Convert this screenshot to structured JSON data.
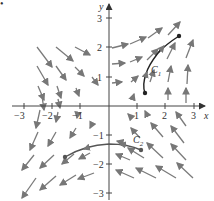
{
  "figure": {
    "dot_marker": "•",
    "axes": {
      "x_label": "x",
      "y_label": "y",
      "x_ticks": [
        "−3",
        "−2",
        "−1",
        "1",
        "2",
        "3"
      ],
      "y_ticks": [
        "3",
        "2",
        "1",
        "−1",
        "−2",
        "−3"
      ]
    },
    "curves": [
      {
        "name": "C",
        "subscript": "1"
      },
      {
        "name": "C",
        "subscript": "2"
      }
    ],
    "colors": {
      "arrows": "#7a7a7a",
      "axes": "#444444",
      "curves": "#222222"
    }
  }
}
